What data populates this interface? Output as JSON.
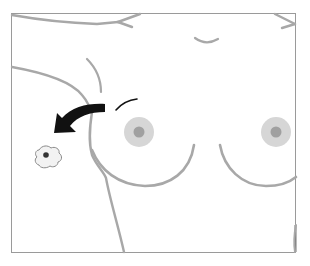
{
  "figure": {
    "type": "anatomical-illustration",
    "colors": {
      "frame": "#9a9a9a",
      "outline": "#a8a8a8",
      "areola": "#d6d6d6",
      "nipple": "#a0a0a0",
      "arrow": "#111111",
      "cell_fill": "#f2f2f2",
      "cell_outline": "#8a8a8a",
      "cell_nucleus": "#333333"
    },
    "elements": [
      {
        "name": "torso-frame"
      },
      {
        "name": "left-breast"
      },
      {
        "name": "right-breast"
      },
      {
        "name": "migration-arrow",
        "direction": "toward axilla"
      },
      {
        "name": "migrating-cell"
      }
    ]
  },
  "caption": {
    "left": "",
    "right": ""
  }
}
